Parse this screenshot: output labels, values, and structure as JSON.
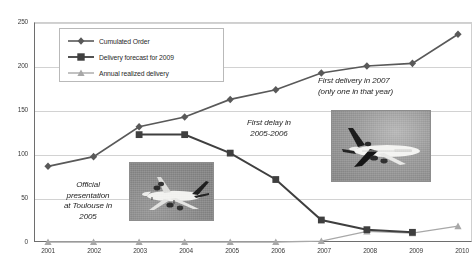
{
  "chart_data": {
    "type": "line",
    "title": "",
    "xlabel": "",
    "ylabel": "",
    "categories": [
      "2001",
      "2002",
      "2003",
      "2004",
      "2005",
      "2006",
      "2007",
      "2008",
      "2009",
      "2010"
    ],
    "ylim": [
      0,
      250
    ],
    "yticks": [
      "0",
      "50",
      "100",
      "150",
      "200",
      "250"
    ],
    "grid": true,
    "legend_position": "top-left",
    "series": [
      {
        "name": "Cumulated Order",
        "marker": "diamond",
        "color": "#595959",
        "values": [
          86,
          97,
          131,
          142,
          162,
          173,
          192,
          200,
          203,
          236
        ]
      },
      {
        "name": "Delivery forecast for 2009",
        "marker": "square",
        "color": "#3f3f3f",
        "values": [
          null,
          null,
          122,
          122,
          101,
          71,
          25,
          14,
          11,
          null
        ]
      },
      {
        "name": "Annual realized delivery",
        "marker": "triangle",
        "color": "#a8a8a8",
        "values": [
          0,
          0,
          0,
          0,
          0,
          0,
          1,
          12,
          10,
          18
        ]
      }
    ],
    "annotations": [
      {
        "id": "toulouse",
        "text": "Official\npresentation\nat Toulouse in\n2005"
      },
      {
        "id": "delay",
        "text": "First delay in\n2005-2006"
      },
      {
        "id": "delivery",
        "text": "First delivery in 2007\n(only one in that year)"
      }
    ],
    "images": [
      {
        "id": "a380-ground",
        "caption": "Airbus A380 aircraft photograph"
      },
      {
        "id": "a380-flight",
        "caption": "Airbus A380 in flight photograph"
      }
    ]
  },
  "colors": {
    "axis": "#6e6e6e",
    "grid": "#d2d2d2",
    "background": "#ffffff"
  }
}
